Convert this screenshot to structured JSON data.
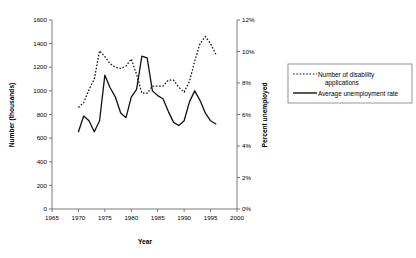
{
  "chart_data": {
    "type": "line",
    "title": "",
    "subtitle": "",
    "xlabel": "Year",
    "ylabel": "Number (thousands)",
    "y2label": "Percent unemployed",
    "xlim": [
      1965,
      2000
    ],
    "ylim": [
      0,
      1600
    ],
    "y2lim": [
      0,
      0.12
    ],
    "grid": false,
    "legend_position": "right",
    "x_ticks": [
      "1965",
      "1970",
      "1975",
      "1980",
      "1985",
      "1990",
      "1995",
      "2000"
    ],
    "x_tick_values": [
      1965,
      1970,
      1975,
      1980,
      1985,
      1990,
      1995,
      2000
    ],
    "y_ticks": [
      "0",
      "200",
      "400",
      "600",
      "800",
      "1000",
      "1200",
      "1400",
      "1600"
    ],
    "y_tick_values": [
      0,
      200,
      400,
      600,
      800,
      1000,
      1200,
      1400,
      1600
    ],
    "y2_ticks": [
      "0%",
      "2%",
      "4%",
      "6%",
      "8%",
      "10%",
      "12%"
    ],
    "y2_tick_values": [
      0,
      2,
      4,
      6,
      8,
      10,
      12
    ],
    "series": [
      {
        "name": "Number of disability applications",
        "axis": "left",
        "style": "dotted",
        "units": "thousands",
        "x": [
          1970,
          1971,
          1972,
          1973,
          1974,
          1975,
          1976,
          1977,
          1978,
          1979,
          1980,
          1981,
          1982,
          1983,
          1984,
          1985,
          1986,
          1987,
          1988,
          1989,
          1990,
          1991,
          1992,
          1993,
          1994,
          1995,
          1996
        ],
        "values": [
          860,
          900,
          1010,
          1100,
          1340,
          1290,
          1230,
          1200,
          1190,
          1210,
          1270,
          1140,
          980,
          980,
          1040,
          1040,
          1040,
          1090,
          1090,
          1030,
          990,
          1080,
          1250,
          1400,
          1460,
          1400,
          1310
        ]
      },
      {
        "name": "Average unemployment rate",
        "axis": "right",
        "style": "solid",
        "units": "percent",
        "x": [
          1970,
          1971,
          1972,
          1973,
          1974,
          1975,
          1976,
          1977,
          1978,
          1979,
          1980,
          1981,
          1982,
          1983,
          1984,
          1985,
          1986,
          1987,
          1988,
          1989,
          1990,
          1991,
          1992,
          1993,
          1994,
          1995,
          1996
        ],
        "values": [
          4.9,
          5.9,
          5.6,
          4.9,
          5.6,
          8.5,
          7.7,
          7.1,
          6.1,
          5.8,
          7.1,
          7.6,
          9.7,
          9.6,
          7.5,
          7.2,
          7.0,
          6.2,
          5.5,
          5.3,
          5.6,
          6.8,
          7.5,
          6.9,
          6.1,
          5.6,
          5.4
        ]
      }
    ],
    "legend_entries": [
      {
        "label_line1": "Number of disability",
        "label_line2": "applications",
        "style": "dotted"
      },
      {
        "label_line1": "Average unemployment rate",
        "label_line2": "",
        "style": "solid"
      }
    ]
  }
}
